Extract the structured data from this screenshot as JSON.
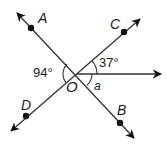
{
  "diagram": {
    "type": "angle-diagram",
    "center": {
      "label": "O",
      "x": 77,
      "y": 74
    },
    "points": [
      {
        "id": "A",
        "label": "A",
        "x": 31,
        "y": 28,
        "arrow_to": [
          17,
          13
        ],
        "label_x": 38,
        "label_y": 11
      },
      {
        "id": "C",
        "label": "C",
        "x": 124,
        "y": 32,
        "arrow_to": [
          140,
          19
        ],
        "label_x": 110,
        "label_y": 17
      },
      {
        "id": "D",
        "label": "D",
        "x": 26,
        "y": 116,
        "arrow_to": [
          11,
          131
        ],
        "label_x": 21,
        "label_y": 98
      },
      {
        "id": "B",
        "label": "B",
        "x": 120,
        "y": 123,
        "arrow_to": [
          134,
          138
        ],
        "label_x": 117,
        "label_y": 103
      }
    ],
    "ray": {
      "from": [
        77,
        74
      ],
      "to": [
        161,
        74
      ]
    },
    "angles": [
      {
        "name": "angle-AOD",
        "text": "94°",
        "label_x": 33,
        "label_y": 66
      },
      {
        "name": "angle-C-horizontal",
        "text": "37°",
        "label_x": 99,
        "label_y": 56
      },
      {
        "name": "angle-a",
        "text": "a",
        "label_x": 94,
        "label_y": 80
      }
    ],
    "colors": {
      "line": "#333333",
      "dot": "#111111",
      "text": "#1a1a1a"
    }
  }
}
